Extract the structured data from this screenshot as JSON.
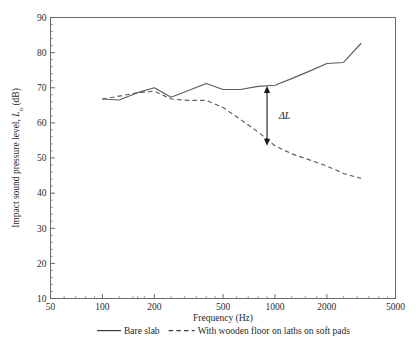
{
  "chart_data": {
    "type": "line",
    "title": "",
    "xlabel": "Frequency (Hz)",
    "ylabel": "Impact sound pressure level, Lₙ (dB)",
    "ylabel_main": "Impact sound pressure level, ",
    "ylabel_symbol": "L",
    "ylabel_subscript": "n",
    "ylabel_unit": " (dB)",
    "xscale": "log",
    "xlim": [
      50,
      5000
    ],
    "ylim": [
      10,
      90
    ],
    "grid": false,
    "legend_position": "below-plot",
    "xticks": [
      50,
      100,
      200,
      500,
      1000,
      2000,
      5000
    ],
    "xticklabels": [
      "50",
      "100",
      "200",
      "500",
      "1000",
      "2000",
      "5000"
    ],
    "yticks": [
      10,
      20,
      30,
      40,
      50,
      60,
      70,
      80,
      90
    ],
    "yticklabels": [
      "10",
      "20",
      "30",
      "40",
      "50",
      "60",
      "70",
      "80",
      "90"
    ],
    "annotations": [
      {
        "text": "ΔL",
        "type": "double-arrow",
        "x": 900,
        "y_top": 70.5,
        "y_bottom": 53.5,
        "label_x": 1000,
        "label_y": 61
      }
    ],
    "series": [
      {
        "name": "Bare slab",
        "style": "solid",
        "x": [
          100,
          125,
          160,
          200,
          250,
          315,
          400,
          500,
          630,
          800,
          1000,
          1250,
          1600,
          2000,
          2500,
          3150
        ],
        "values": [
          66.8,
          66.5,
          68.6,
          70.0,
          67.3,
          69.2,
          71.2,
          69.5,
          69.5,
          70.4,
          70.7,
          72.6,
          74.8,
          76.9,
          77.2,
          82.6
        ]
      },
      {
        "name": "With wooden floor on laths on soft pads",
        "style": "dashed",
        "x": [
          100,
          125,
          160,
          200,
          250,
          315,
          400,
          500,
          630,
          800,
          1000,
          1250,
          1600,
          2000,
          2500,
          3150
        ],
        "values": [
          66.8,
          67.6,
          68.6,
          69.0,
          66.8,
          66.4,
          66.4,
          64.4,
          61.0,
          57.4,
          53.5,
          51.2,
          49.4,
          47.7,
          45.6,
          44.2
        ]
      }
    ]
  },
  "legend": {
    "items": [
      {
        "label": "Bare slab",
        "style": "solid"
      },
      {
        "label": "With wooden floor on laths on soft pads",
        "style": "dashed"
      }
    ]
  }
}
